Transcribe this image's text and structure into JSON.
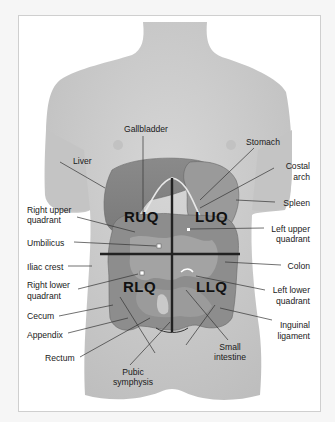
{
  "figure": {
    "quadrants": {
      "ruq": "RUQ",
      "luq": "LUQ",
      "rlq": "RLQ",
      "llq": "LLQ"
    },
    "labels_left": {
      "liver": "Liver",
      "right_upper_quadrant_1": "Right upper",
      "right_upper_quadrant_2": "quadrant",
      "umbilicus": "Umbilicus",
      "iliac_crest": "Iliac crest",
      "right_lower_quadrant_1": "Right lower",
      "right_lower_quadrant_2": "quadrant",
      "cecum": "Cecum",
      "appendix": "Appendix",
      "rectum": "Rectum"
    },
    "labels_top": {
      "gallbladder": "Gallbladder",
      "stomach": "Stomach"
    },
    "labels_right": {
      "costal_arch_1": "Costal",
      "costal_arch_2": "arch",
      "spleen": "Spleen",
      "left_upper_quadrant_1": "Left upper",
      "left_upper_quadrant_2": "quadrant",
      "colon": "Colon",
      "left_lower_quadrant_1": "Left lower",
      "left_lower_quadrant_2": "quadrant",
      "inguinal_ligament_1": "Inguinal",
      "inguinal_ligament_2": "ligament"
    },
    "labels_bottom": {
      "pubic_symphysis_1": "Pubic",
      "pubic_symphysis_2": "symphysis",
      "small_intestine_1": "Small",
      "small_intestine_2": "intestine"
    },
    "colors": {
      "skin": "#cfcfcf",
      "skin_shadow": "#b9b9b9",
      "organ_dark": "#7a7a7a",
      "organ_mid": "#8f8f8f",
      "organ_light": "#a6a6a6",
      "leader_line": "#333333",
      "quadrant_line": "#222222"
    }
  }
}
